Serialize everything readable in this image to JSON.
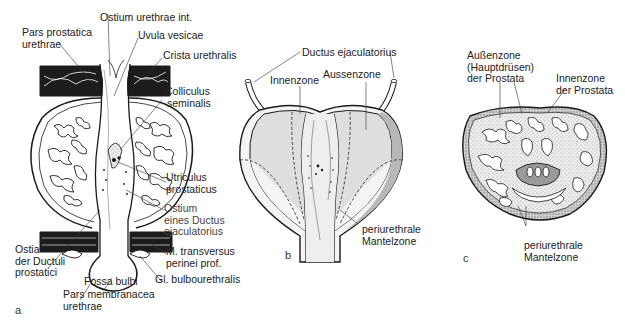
{
  "figure": {
    "panels": [
      {
        "id": "a",
        "letter": "a",
        "labels": {
          "pars_prostatica_1": "Pars prostatica",
          "pars_prostatica_2": "urethrae",
          "ostium_urethrae_int": "Ostium urethrae int.",
          "uvula_vesicae": "Uvula vesicae",
          "crista_urethralis": "Crista urethralis",
          "colliculus_1": "Colliculus",
          "colliculus_2": "seminalis",
          "utriculus_1": "Utriculus",
          "utriculus_2": "prostaticus",
          "ostium_ductus_1": "Ostium",
          "ostium_ductus_2": "eines Ductus",
          "ostium_ductus_3": "ejaculatorius",
          "ostia_ductuli_1": "Ostia",
          "ostia_ductuli_2": "der Ductuli",
          "ostia_ductuli_3": "prostatici",
          "m_transversus_1": "M. transversus",
          "m_transversus_2": "perinei prof.",
          "fossa_bulbi": "Fossa bulbi",
          "gl_bulbourethralis": "Gl. bulbourethralis",
          "pars_membranacea_1": "Pars membranacea",
          "pars_membranacea_2": "urethrae"
        }
      },
      {
        "id": "b",
        "letter": "b",
        "labels": {
          "ductus_ejaculatorius": "Ductus ejaculatorius",
          "innenzone": "Innenzone",
          "aussenzone": "Aussenzone",
          "periurethrale_1": "periurethrale",
          "periurethrale_2": "Mantelzone"
        }
      },
      {
        "id": "c",
        "letter": "c",
        "labels": {
          "aussenzone_1": "Außenzone",
          "aussenzone_2": "(Hauptdrüsen)",
          "aussenzone_3": "der Prostata",
          "innenzone_1": "Innenzone",
          "innenzone_2": "der Prostata",
          "periurethrale_1": "periurethrale",
          "periurethrale_2": "Mantelzone"
        }
      }
    ],
    "colors": {
      "ink": "#1a1a1a",
      "shade": "#d9d9d9",
      "light_shade": "#e8e8e8",
      "stipple": "#bdbdbd"
    }
  }
}
